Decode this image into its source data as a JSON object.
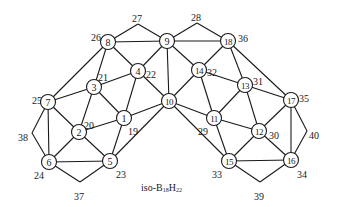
{
  "caption": {
    "prefix": "iso-B",
    "b_sub": "18",
    "h": "H",
    "h_sub": "22"
  },
  "nodes": [
    {
      "id": "1",
      "x": 124,
      "y": 118
    },
    {
      "id": "2",
      "x": 79,
      "y": 132
    },
    {
      "id": "3",
      "x": 94,
      "y": 87
    },
    {
      "id": "4",
      "x": 138,
      "y": 71
    },
    {
      "id": "5",
      "x": 110,
      "y": 161
    },
    {
      "id": "6",
      "x": 49,
      "y": 162
    },
    {
      "id": "7",
      "x": 48,
      "y": 102
    },
    {
      "id": "8",
      "x": 108,
      "y": 42
    },
    {
      "id": "9",
      "x": 167,
      "y": 41
    },
    {
      "id": "10",
      "x": 169,
      "y": 101
    },
    {
      "id": "11",
      "x": 214,
      "y": 118
    },
    {
      "id": "12",
      "x": 259,
      "y": 131
    },
    {
      "id": "13",
      "x": 245,
      "y": 85
    },
    {
      "id": "14",
      "x": 199,
      "y": 70
    },
    {
      "id": "15",
      "x": 229,
      "y": 161
    },
    {
      "id": "16",
      "x": 291,
      "y": 160
    },
    {
      "id": "17",
      "x": 291,
      "y": 100
    },
    {
      "id": "18",
      "x": 228,
      "y": 41
    }
  ],
  "vertices": [
    {
      "id": "27",
      "x": 138,
      "y": 24
    },
    {
      "id": "28",
      "x": 197,
      "y": 23
    },
    {
      "id": "38",
      "x": 32,
      "y": 133
    },
    {
      "id": "40",
      "x": 307,
      "y": 131
    },
    {
      "id": "37",
      "x": 80,
      "y": 182
    },
    {
      "id": "39",
      "x": 260,
      "y": 182
    }
  ],
  "labels": [
    {
      "text": "26",
      "x": 91,
      "y": 37
    },
    {
      "text": "27",
      "x": 132,
      "y": 18
    },
    {
      "text": "28",
      "x": 191,
      "y": 17
    },
    {
      "text": "36",
      "x": 238,
      "y": 38
    },
    {
      "text": "21",
      "x": 98,
      "y": 77
    },
    {
      "text": "22",
      "x": 146,
      "y": 74
    },
    {
      "text": "32",
      "x": 207,
      "y": 72
    },
    {
      "text": "31",
      "x": 253,
      "y": 81
    },
    {
      "text": "25",
      "x": 32,
      "y": 100
    },
    {
      "text": "35",
      "x": 299,
      "y": 98
    },
    {
      "text": "20",
      "x": 84,
      "y": 125
    },
    {
      "text": "19",
      "x": 128,
      "y": 131
    },
    {
      "text": "29",
      "x": 198,
      "y": 131
    },
    {
      "text": "30",
      "x": 269,
      "y": 135
    },
    {
      "text": "38",
      "x": 18,
      "y": 137
    },
    {
      "text": "40",
      "x": 309,
      "y": 135
    },
    {
      "text": "24",
      "x": 34,
      "y": 175
    },
    {
      "text": "23",
      "x": 116,
      "y": 174
    },
    {
      "text": "33",
      "x": 212,
      "y": 174
    },
    {
      "text": "34",
      "x": 297,
      "y": 174
    },
    {
      "text": "37",
      "x": 74,
      "y": 196
    },
    {
      "text": "39",
      "x": 254,
      "y": 196
    }
  ],
  "edges": [
    [
      "8",
      "9"
    ],
    [
      "9",
      "18"
    ],
    [
      "8",
      "27"
    ],
    [
      "27",
      "9"
    ],
    [
      "9",
      "28"
    ],
    [
      "28",
      "18"
    ],
    [
      "8",
      "4"
    ],
    [
      "8",
      "3"
    ],
    [
      "8",
      "7"
    ],
    [
      "9",
      "4"
    ],
    [
      "9",
      "10"
    ],
    [
      "9",
      "14"
    ],
    [
      "18",
      "14"
    ],
    [
      "18",
      "13"
    ],
    [
      "18",
      "17"
    ],
    [
      "4",
      "3"
    ],
    [
      "4",
      "1"
    ],
    [
      "4",
      "10"
    ],
    [
      "14",
      "13"
    ],
    [
      "14",
      "11"
    ],
    [
      "14",
      "10"
    ],
    [
      "3",
      "7"
    ],
    [
      "3",
      "2"
    ],
    [
      "3",
      "1"
    ],
    [
      "13",
      "17"
    ],
    [
      "13",
      "12"
    ],
    [
      "13",
      "11"
    ],
    [
      "7",
      "2"
    ],
    [
      "7",
      "6"
    ],
    [
      "7",
      "38"
    ],
    [
      "38",
      "6"
    ],
    [
      "17",
      "12"
    ],
    [
      "17",
      "16"
    ],
    [
      "17",
      "40"
    ],
    [
      "40",
      "16"
    ],
    [
      "1",
      "2"
    ],
    [
      "1",
      "10"
    ],
    [
      "1",
      "5"
    ],
    [
      "11",
      "10"
    ],
    [
      "11",
      "12"
    ],
    [
      "11",
      "15"
    ],
    [
      "10",
      "5"
    ],
    [
      "10",
      "15"
    ],
    [
      "2",
      "6"
    ],
    [
      "2",
      "5"
    ],
    [
      "12",
      "15"
    ],
    [
      "12",
      "16"
    ],
    [
      "6",
      "5"
    ],
    [
      "6",
      "37"
    ],
    [
      "37",
      "5"
    ],
    [
      "15",
      "16"
    ],
    [
      "15",
      "39"
    ],
    [
      "39",
      "16"
    ]
  ]
}
